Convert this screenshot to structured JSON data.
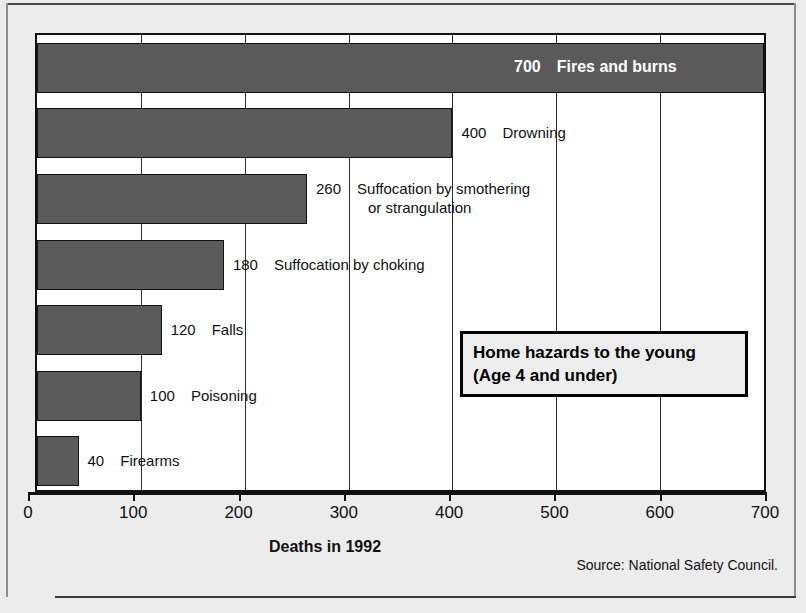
{
  "chart_data": {
    "type": "bar",
    "orientation": "horizontal",
    "title": "Home hazards to the young (Age 4 and under)",
    "xlabel": "Deaths in 1992",
    "ylabel": "",
    "xlim": [
      0,
      700
    ],
    "grid": true,
    "legend": "none",
    "source": "Source: National Safety Council.",
    "categories": [
      "Fires and burns",
      "Drowning",
      "Suffocation by smothering or strangulation",
      "Suffocation by choking",
      "Falls",
      "Poisoning",
      "Firearms"
    ],
    "values": [
      700,
      400,
      260,
      180,
      120,
      100,
      40
    ],
    "xticks": [
      0,
      100,
      200,
      300,
      400,
      500,
      600,
      700
    ],
    "xticklabels": [
      "0",
      "100",
      "200",
      "300",
      "400",
      "500",
      "600",
      "700"
    ]
  },
  "callout": {
    "line1": "Home hazards to the young",
    "line2": "(Age 4 and under)"
  },
  "bars": [
    {
      "value_label": "700",
      "name": "Fires and burns",
      "label_inside": true
    },
    {
      "value_label": "400",
      "name": "Drowning",
      "label_inside": false
    },
    {
      "value_label": "260",
      "name": "Suffocation by smothering",
      "name2": "or strangulation",
      "label_inside": false
    },
    {
      "value_label": "180",
      "name": "Suffocation by choking",
      "label_inside": false
    },
    {
      "value_label": "120",
      "name": "Falls",
      "label_inside": false
    },
    {
      "value_label": "100",
      "name": "Poisoning",
      "label_inside": false
    },
    {
      "value_label": "40",
      "name": "Firearms",
      "label_inside": false
    }
  ],
  "axis": {
    "xlabel": "Deaths in 1992",
    "source": "Source: National Safety Council."
  },
  "colors": {
    "bar_fill": "#5a5a5a",
    "plot_bg": "#ffffff",
    "figure_bg": "#ececec",
    "ink": "#111111"
  }
}
